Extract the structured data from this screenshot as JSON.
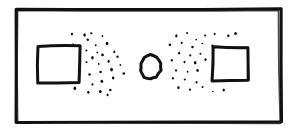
{
  "canvas": {
    "width": 299,
    "height": 129,
    "background_color": "#ffffff",
    "ink_color": "#111111",
    "style": "hand-drawn-sketch"
  },
  "chart_data": {
    "type": "scatter",
    "title": "",
    "xlabel": "",
    "ylabel": "",
    "xlim": [
      0,
      299
    ],
    "ylim": [
      0,
      129
    ],
    "grid": false,
    "legend": null,
    "series": [
      {
        "name": "left-dot-cloud",
        "marker": "dot",
        "color": "#111111",
        "point_count": 30,
        "points": [
          [
            84,
            35
          ],
          [
            88,
            40
          ],
          [
            72,
            34
          ],
          [
            73,
            44
          ],
          [
            91,
            33
          ],
          [
            102,
            36
          ],
          [
            107,
            44
          ],
          [
            96,
            45
          ],
          [
            86,
            50
          ],
          [
            97,
            52
          ],
          [
            114,
            52
          ],
          [
            103,
            55
          ],
          [
            92,
            58
          ],
          [
            118,
            57
          ],
          [
            109,
            61
          ],
          [
            99,
            64
          ],
          [
            87,
            62
          ],
          [
            120,
            65
          ],
          [
            111,
            70
          ],
          [
            100,
            72
          ],
          [
            90,
            74
          ],
          [
            124,
            73
          ],
          [
            113,
            78
          ],
          [
            102,
            81
          ],
          [
            93,
            84
          ],
          [
            75,
            88
          ],
          [
            88,
            92
          ],
          [
            100,
            92
          ],
          [
            110,
            90
          ],
          [
            107,
            95
          ]
        ]
      },
      {
        "name": "right-dot-cloud",
        "marker": "dot",
        "color": "#111111",
        "point_count": 30,
        "points": [
          [
            176,
            36
          ],
          [
            187,
            33
          ],
          [
            196,
            40
          ],
          [
            205,
            36
          ],
          [
            215,
            34
          ],
          [
            228,
            36
          ],
          [
            235,
            33
          ],
          [
            170,
            45
          ],
          [
            182,
            43
          ],
          [
            192,
            47
          ],
          [
            202,
            44
          ],
          [
            212,
            46
          ],
          [
            179,
            53
          ],
          [
            190,
            55
          ],
          [
            200,
            54
          ],
          [
            172,
            60
          ],
          [
            184,
            62
          ],
          [
            195,
            63
          ],
          [
            206,
            60
          ],
          [
            176,
            70
          ],
          [
            187,
            72
          ],
          [
            198,
            71
          ],
          [
            173,
            78
          ],
          [
            185,
            80
          ],
          [
            196,
            82
          ],
          [
            178,
            88
          ],
          [
            190,
            90
          ],
          [
            203,
            87
          ],
          [
            213,
            92
          ],
          [
            224,
            90
          ]
        ]
      }
    ],
    "shapes": [
      {
        "name": "outer-frame",
        "type": "rectangle",
        "filled": false,
        "stroke_width": 3,
        "bounds": {
          "x": 16,
          "y": 9,
          "width": 264,
          "height": 113
        }
      },
      {
        "name": "left-rectangle",
        "type": "rectangle",
        "filled": false,
        "stroke_width": 3,
        "bounds": {
          "x": 38,
          "y": 46,
          "width": 42,
          "height": 36
        }
      },
      {
        "name": "center-oval",
        "type": "ellipse",
        "filled": false,
        "stroke_width": 3,
        "bounds": {
          "x": 140,
          "y": 55,
          "width": 21,
          "height": 24
        }
      },
      {
        "name": "right-rectangle",
        "type": "rectangle",
        "filled": false,
        "stroke_width": 3,
        "bounds": {
          "x": 213,
          "y": 47,
          "width": 36,
          "height": 33
        }
      }
    ]
  }
}
